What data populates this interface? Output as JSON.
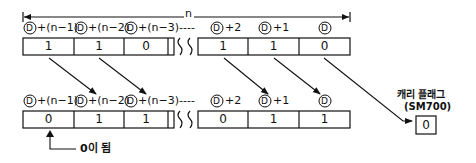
{
  "diagram": {
    "span_label": "n",
    "device_symbol": "D",
    "before": {
      "labels": [
        "+(n−1)",
        "+(n−2)",
        "+(n−3)----",
        "+2",
        "+1",
        ""
      ],
      "values": [
        "1",
        "1",
        "0",
        "1",
        "1",
        "0"
      ]
    },
    "after": {
      "labels": [
        "+(n−1)",
        "+(n−2)",
        "+(n−3)----",
        "+2",
        "+1",
        ""
      ],
      "values": [
        "0",
        "1",
        "1",
        "0",
        "1",
        "1"
      ]
    },
    "carry_flag": {
      "title": "캐리 플래그",
      "device": "(SM700)",
      "value": "0"
    },
    "fill_note": "0이 됨"
  }
}
